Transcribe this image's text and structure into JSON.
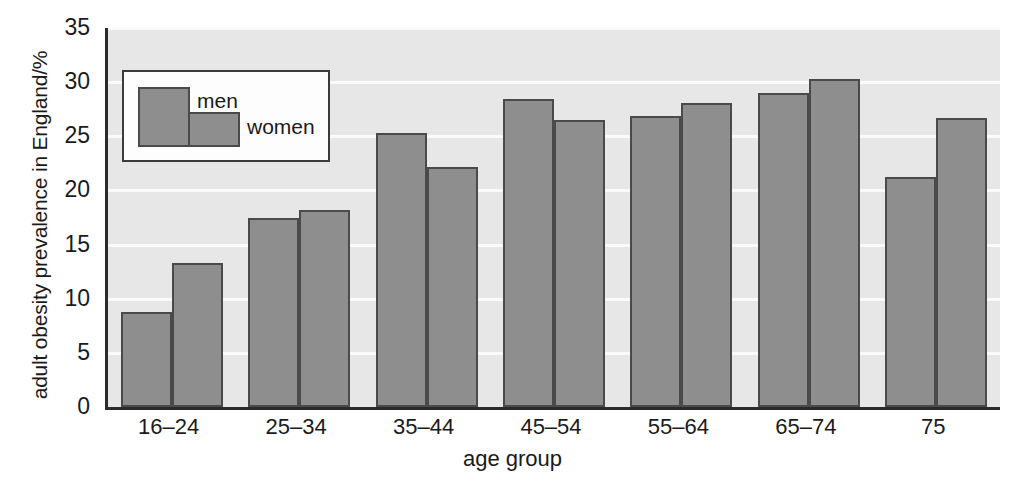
{
  "chart_data": {
    "type": "bar",
    "title": "",
    "xlabel": "age group",
    "ylabel": "adult obesity prevalence in England/%",
    "categories": [
      "16–24",
      "25–34",
      "35–44",
      "45–54",
      "55–64",
      "65–74",
      "75"
    ],
    "series": [
      {
        "name": "men",
        "values": [
          8.8,
          17.5,
          25.3,
          28.4,
          26.9,
          29.0,
          21.2
        ]
      },
      {
        "name": "women",
        "values": [
          13.3,
          18.2,
          22.2,
          26.5,
          28.1,
          30.3,
          26.7
        ]
      }
    ],
    "ylim": [
      0,
      35
    ],
    "ytick_values": [
      0,
      5,
      10,
      15,
      20,
      25,
      30,
      35
    ],
    "ytick_labels": [
      "0",
      "5",
      "10",
      "15",
      "20",
      "25",
      "30",
      "35"
    ],
    "grid": true,
    "legend_position": "upper left",
    "colors": {
      "bar_fill": "#8e8e8e",
      "bar_edge": "#4a4a4a",
      "plot_background": "#e7e7e7",
      "gridline": "#fafafa",
      "axis": "#2b2b2b",
      "text": "#1a1a1a",
      "legend_background": "#fdfdfd"
    }
  }
}
